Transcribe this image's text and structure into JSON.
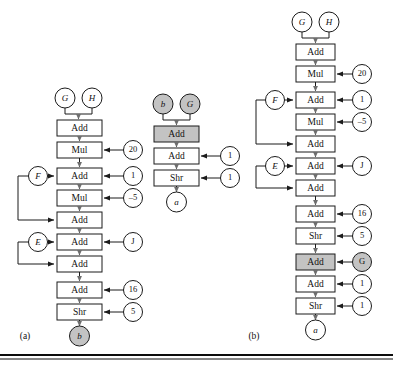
{
  "figure": {
    "background": "#ffffff",
    "line_color": "#1b1b1b",
    "shade_color": "#c3c3c3",
    "captions": [
      {
        "id": "caption-a",
        "text": "(a)"
      },
      {
        "id": "caption-b",
        "text": "(b)"
      }
    ]
  },
  "panel_a": {
    "caption": "(a)",
    "inputs": [
      {
        "name": "G",
        "shaded": false
      },
      {
        "name": "H",
        "shaded": false
      }
    ],
    "output": {
      "name": "b",
      "shaded": true
    },
    "side_inputs": [
      {
        "name": "F",
        "row": 2
      },
      {
        "name": "E",
        "row": 5
      }
    ],
    "ops": [
      {
        "label": "Add",
        "constant": null,
        "shaded": false
      },
      {
        "label": "Mul",
        "constant": "20",
        "shaded": false
      },
      {
        "label": "Add",
        "constant": "1",
        "shaded": false
      },
      {
        "label": "Mul",
        "constant": "–5",
        "shaded": false
      },
      {
        "label": "Add",
        "constant": null,
        "shaded": false
      },
      {
        "label": "Add",
        "constant": "J",
        "shaded": false
      },
      {
        "label": "Add",
        "constant": null,
        "shaded": false
      },
      {
        "label": "Add",
        "constant": "16",
        "shaded": false
      },
      {
        "label": "Shr",
        "constant": "5",
        "shaded": false
      }
    ]
  },
  "panel_mid": {
    "inputs": [
      {
        "name": "b",
        "shaded": true
      },
      {
        "name": "G",
        "shaded": true
      }
    ],
    "output": {
      "name": "a",
      "shaded": false
    },
    "ops": [
      {
        "label": "Add",
        "constant": null,
        "shaded": true
      },
      {
        "label": "Add",
        "constant": "1",
        "shaded": false
      },
      {
        "label": "Shr",
        "constant": "1",
        "shaded": false
      }
    ]
  },
  "panel_b": {
    "caption": "(b)",
    "inputs": [
      {
        "name": "G",
        "shaded": false
      },
      {
        "name": "H",
        "shaded": false
      }
    ],
    "output": {
      "name": "a",
      "shaded": false
    },
    "side_inputs": [
      {
        "name": "F",
        "row": 2
      },
      {
        "name": "E",
        "row": 5
      }
    ],
    "ops": [
      {
        "label": "Add",
        "constant": null,
        "shaded": false
      },
      {
        "label": "Mul",
        "constant": "20",
        "shaded": false
      },
      {
        "label": "Add",
        "constant": "1",
        "shaded": false
      },
      {
        "label": "Mul",
        "constant": "–5",
        "shaded": false
      },
      {
        "label": "Add",
        "constant": null,
        "shaded": false
      },
      {
        "label": "Add",
        "constant": "J",
        "shaded": false
      },
      {
        "label": "Add",
        "constant": null,
        "shaded": false
      },
      {
        "label": "Add",
        "constant": "16",
        "shaded": false
      },
      {
        "label": "Shr",
        "constant": "5",
        "shaded": false
      },
      {
        "label": "Add",
        "constant": "G",
        "shaded": true,
        "constant_shaded": true
      },
      {
        "label": "Add",
        "constant": "1",
        "shaded": false
      },
      {
        "label": "Shr",
        "constant": "1",
        "shaded": false
      }
    ]
  }
}
